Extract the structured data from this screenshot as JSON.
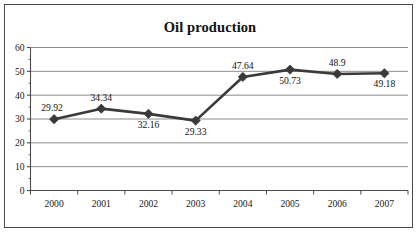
{
  "chart_data": {
    "type": "line",
    "title": "Oil production",
    "xlabel": "",
    "ylabel": "",
    "categories": [
      "2000",
      "2001",
      "2002",
      "2003",
      "2004",
      "2005",
      "2006",
      "2007"
    ],
    "values": [
      29.92,
      34.34,
      32.16,
      29.33,
      47.64,
      50.73,
      48.9,
      49.18
    ],
    "data_labels": [
      "29.92",
      "34.34",
      "32.16",
      "29.33",
      "47.64",
      "50.73",
      "48.9",
      "49.18"
    ],
    "data_label_positions": [
      "above-left",
      "above",
      "below",
      "below",
      "above",
      "below",
      "above",
      "below"
    ],
    "ylim": [
      0,
      60
    ],
    "yticks": [
      0,
      10,
      20,
      30,
      40,
      50,
      60
    ],
    "ytick_labels": [
      "0",
      "10",
      "20",
      "30",
      "40",
      "50",
      "60"
    ],
    "minor_yticks": [
      5,
      15,
      25,
      35,
      45,
      55
    ],
    "grid": "horizontal",
    "legend": "none",
    "series_color": "#3a3a3a",
    "gridline_color": "#808080",
    "axis_color": "#4a4a4a",
    "marker": "diamond",
    "plot_background": "#ffffff"
  },
  "figure": {
    "border_color": "#4a4a4a",
    "background": "#ffffff"
  }
}
